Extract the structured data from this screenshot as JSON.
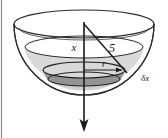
{
  "figure": {
    "canvas": {
      "width": 168,
      "height": 138
    },
    "background_color": "#ffffff",
    "border": {
      "side": "left",
      "color": "#8c8c8c",
      "width_px": 1
    },
    "labels": {
      "axis_depth": "x",
      "slant": "5",
      "radius": "r",
      "thickness": "δx"
    },
    "colors": {
      "outline": "#2b2b2b",
      "upper_shade": "#d9d9d9",
      "lower_shade": "#cfcfcf",
      "disk_shade": "#8f8f8f",
      "arrow": "#1a1a1a",
      "label": "#1a1a1a"
    },
    "geometry": {
      "rim_ellipse": {
        "cx": 84,
        "cy": 24,
        "rx": 70,
        "ry": 14
      },
      "water_ellipse": {
        "cx": 84,
        "cy": 47,
        "rx": 59,
        "ry": 11
      },
      "disk_top_ellipse": {
        "cx": 84,
        "cy": 70,
        "rx": 41,
        "ry": 8
      },
      "disk_bottom_ellipse": {
        "cx": 84,
        "cy": 79,
        "rx": 36,
        "ry": 7
      },
      "bowl_bottom_y": 95,
      "axis": {
        "x": 84,
        "y_top": 24,
        "y_bottom": 130
      },
      "slant_line": {
        "x1": 84,
        "y1": 24,
        "x2": 127,
        "y2": 73
      },
      "radius_line": {
        "x1": 84,
        "y1": 70,
        "x2": 121,
        "y2": 70
      }
    }
  }
}
